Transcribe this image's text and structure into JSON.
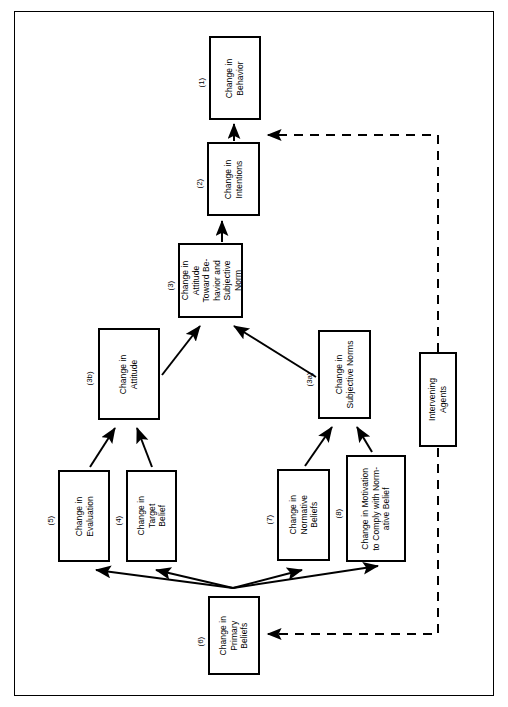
{
  "diagram": {
    "frame": {
      "border_color": "#000000"
    },
    "nodes": [
      {
        "id": "1",
        "number": "(1)",
        "text": "Change in\nBehavior"
      },
      {
        "id": "2",
        "number": "(2)",
        "text": "Change in\nIntentions"
      },
      {
        "id": "3",
        "number": "(3)",
        "text": "Change in\nAttitude\nToward Be-\nhavior and\nSubjective\nNorm"
      },
      {
        "id": "3b",
        "number": "(3b)",
        "text": "Change in\nAttitude"
      },
      {
        "id": "3a",
        "number": "(3a)",
        "text": "Change in\nSubjective Norms"
      },
      {
        "id": "5",
        "number": "(5)",
        "text": "Change in\nEvaluation"
      },
      {
        "id": "4",
        "number": "(4)",
        "text": "Change in\nTarget\nBelief"
      },
      {
        "id": "7",
        "number": "(7)",
        "text": "Change in\nNormative\nBeliefs"
      },
      {
        "id": "8",
        "number": "(8)",
        "text": "Change in Motivation\nto Comply with Norm-\native Belief"
      },
      {
        "id": "6",
        "number": "(6)",
        "text": "Change in\nPrimary\nBeliefs"
      },
      {
        "id": "ia",
        "number": "",
        "text": "Intervening\nAgents"
      }
    ],
    "edges": [
      {
        "from": "2",
        "to": "1",
        "style": "solid"
      },
      {
        "from": "3",
        "to": "2",
        "style": "solid"
      },
      {
        "from": "3b",
        "to": "3",
        "style": "solid"
      },
      {
        "from": "3a",
        "to": "3",
        "style": "solid"
      },
      {
        "from": "5",
        "to": "3b",
        "style": "solid"
      },
      {
        "from": "4",
        "to": "3b",
        "style": "solid"
      },
      {
        "from": "7",
        "to": "3a",
        "style": "solid"
      },
      {
        "from": "8",
        "to": "3a",
        "style": "solid"
      },
      {
        "from": "6",
        "to": "5",
        "style": "solid"
      },
      {
        "from": "6",
        "to": "4",
        "style": "solid"
      },
      {
        "from": "6",
        "to": "7",
        "style": "solid"
      },
      {
        "from": "6",
        "to": "8",
        "style": "solid"
      },
      {
        "from": "ia",
        "to": "1",
        "style": "dashed"
      },
      {
        "from": "ia",
        "to": "6",
        "style": "dashed"
      }
    ],
    "colors": {
      "stroke": "#000000",
      "background": "#ffffff"
    }
  }
}
